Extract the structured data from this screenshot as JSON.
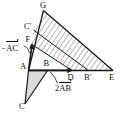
{
  "figure": {
    "type": "geometry-diagram",
    "width": 124,
    "height": 115,
    "background": "#ffffff",
    "stroke_color": "#1a1a1a",
    "hatch_color": "#8a8a8a",
    "fill_gray": "#d8d8d8"
  },
  "points": {
    "G": {
      "label": "G",
      "x": 43.5,
      "y": 10.5,
      "label_x": 40.0,
      "label_y": 1.0
    },
    "Cprime": {
      "label": "C′",
      "x": 33.5,
      "y": 30.0,
      "label_x": 25.0,
      "label_y": 23.0
    },
    "F": {
      "label": "F",
      "x": 32.0,
      "y": 44.5,
      "label_x": 26.0,
      "label_y": 36.5
    },
    "A": {
      "label": "A",
      "x": 28.5,
      "y": 70.5,
      "label_x": 21.0,
      "label_y": 71.0
    },
    "B": {
      "label": "B",
      "x": 47.5,
      "y": 70.5,
      "label_x": 44.0,
      "label_y": 60.5
    },
    "C": {
      "label": "C",
      "x": 25.0,
      "y": 104.0,
      "label_x": 20.0,
      "label_y": 104.0
    },
    "D": {
      "label": "D",
      "x": 72.0,
      "y": 70.5,
      "label_x": 68.0,
      "label_y": 72.0
    },
    "Bprime": {
      "label": "B′",
      "x": 88.5,
      "y": 70.5,
      "label_x": 85.0,
      "label_y": 72.0
    },
    "E": {
      "label": "E",
      "x": 113.0,
      "y": 70.5,
      "label_x": 110.0,
      "label_y": 72.0
    }
  },
  "labels": {
    "minus_AC": {
      "sign": "−",
      "vector": "AC",
      "x": 2.0,
      "y": 45.0
    },
    "two_AB": {
      "prefix": "2",
      "vector": "AB",
      "x": 56.0,
      "y": 86.0
    }
  },
  "segments": [
    {
      "name": "base-A-E",
      "from": "A",
      "to": "E"
    },
    {
      "name": "vertical-A-G",
      "from": "A",
      "to": "G"
    },
    {
      "name": "hypotenuse-G-E",
      "from": "G",
      "to": "E"
    },
    {
      "name": "parallel-Cprime-Bprime",
      "from": "Cprime",
      "to": "Bprime"
    },
    {
      "name": "parallel-F-D",
      "from": "F",
      "to": "D"
    },
    {
      "name": "side-A-C",
      "from": "A",
      "to": "C"
    },
    {
      "name": "side-C-B",
      "from": "C",
      "to": "B"
    }
  ],
  "arrows": [
    {
      "name": "arrow-A-to-F",
      "from": "A",
      "to": "F",
      "label": "minus_AC"
    },
    {
      "name": "arrow-A-to-D",
      "from": "A",
      "to": "D",
      "label": "two_AB"
    }
  ],
  "leaders": [
    {
      "name": "leader-minusAC",
      "from_x": 24.0,
      "from_y": 45.0,
      "to_x": 30.0,
      "to_y": 53.0
    },
    {
      "name": "leader-2AB",
      "from_x": 57.0,
      "from_y": 83.0,
      "to_x": 50.0,
      "to_y": 72.0
    }
  ],
  "regions": [
    {
      "name": "hatched-band-upper",
      "fill": "hatch"
    },
    {
      "name": "hatched-band-lower",
      "fill": "hatch"
    },
    {
      "name": "triangle-ABC",
      "fill": "gray"
    }
  ]
}
